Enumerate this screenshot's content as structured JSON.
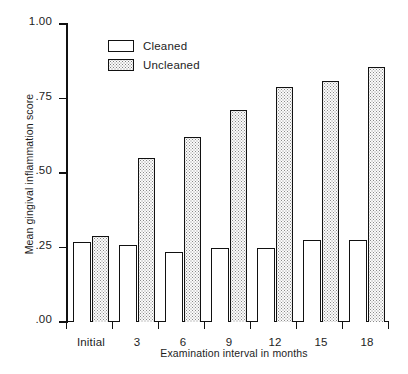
{
  "chart_data": {
    "type": "bar",
    "title": "",
    "xlabel": "Examination interval in months",
    "ylabel": "Mean gingival inflammation score",
    "categories": [
      "Initial",
      "3",
      "6",
      "9",
      "12",
      "15",
      "18"
    ],
    "series": [
      {
        "name": "Cleaned",
        "values": [
          0.27,
          0.26,
          0.235,
          0.25,
          0.25,
          0.275,
          0.275
        ]
      },
      {
        "name": "Uncleaned",
        "values": [
          0.29,
          0.55,
          0.62,
          0.71,
          0.79,
          0.81,
          0.855
        ]
      }
    ],
    "ylim": [
      0.0,
      1.0
    ],
    "ytick_values": [
      0.0,
      0.25,
      0.5,
      0.75,
      1.0
    ],
    "ytick_labels": [
      ".00",
      ".25",
      ".50",
      ".75",
      "1.00"
    ],
    "grid": false,
    "legend_position": "top-center",
    "legend_entries": [
      "Cleaned",
      "Uncleaned"
    ],
    "colors": {
      "cleaned_fill": "#ffffff",
      "uncleaned_fill": "#fbfbfb",
      "outline": "#111111",
      "stipple": "#8a8a8a",
      "text": "#1d1d1d"
    }
  }
}
